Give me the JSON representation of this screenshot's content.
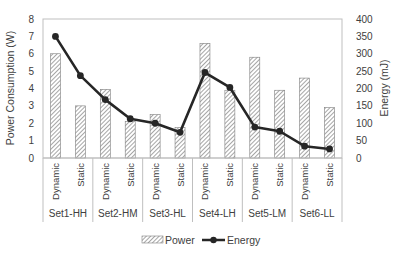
{
  "chart_data": {
    "type": "bar",
    "title": "",
    "groups": [
      "Set1-HH",
      "Set2-HM",
      "Set3-HL",
      "Set4-LH",
      "Set5-LM",
      "Set6-LL"
    ],
    "subcategories": [
      "Dynamic",
      "Static"
    ],
    "categories": [
      "Set1-HH Dynamic",
      "Set1-HH Static",
      "Set2-HM Dynamic",
      "Set2-HM Static",
      "Set3-HL Dynamic",
      "Set3-HL Static",
      "Set4-LH Dynamic",
      "Set4-LH Static",
      "Set5-LM Dynamic",
      "Set5-LM Static",
      "Set6-LL Dynamic",
      "Set6-LL Static"
    ],
    "series": [
      {
        "name": "Power",
        "type": "bar",
        "axis": "left",
        "values": [
          6.0,
          3.0,
          3.95,
          2.1,
          2.5,
          1.75,
          6.6,
          3.9,
          5.8,
          3.9,
          4.6,
          2.9
        ]
      },
      {
        "name": "Energy",
        "type": "line",
        "axis": "right",
        "values": [
          350,
          237,
          168,
          113,
          100,
          74,
          246,
          203,
          89,
          77,
          34,
          26
        ]
      }
    ],
    "ylabel": "Power Consumption (W)",
    "ylim": [
      0,
      8
    ],
    "yticks": [
      0,
      1,
      2,
      3,
      4,
      5,
      6,
      7,
      8
    ],
    "y2label": "Energy (mJ)",
    "y2lim": [
      0,
      400
    ],
    "y2ticks": [
      0,
      50,
      100,
      150,
      200,
      250,
      300,
      350,
      400
    ],
    "grid": false,
    "legend_position": "bottom"
  },
  "legend": {
    "power_label": "Power",
    "energy_label": "Energy"
  },
  "colors": {
    "bar_hatch": "#7f7f7f",
    "bar_fill": "#ffffff",
    "line": "#262626",
    "axis": "#a6a6a6",
    "text": "#404040"
  }
}
